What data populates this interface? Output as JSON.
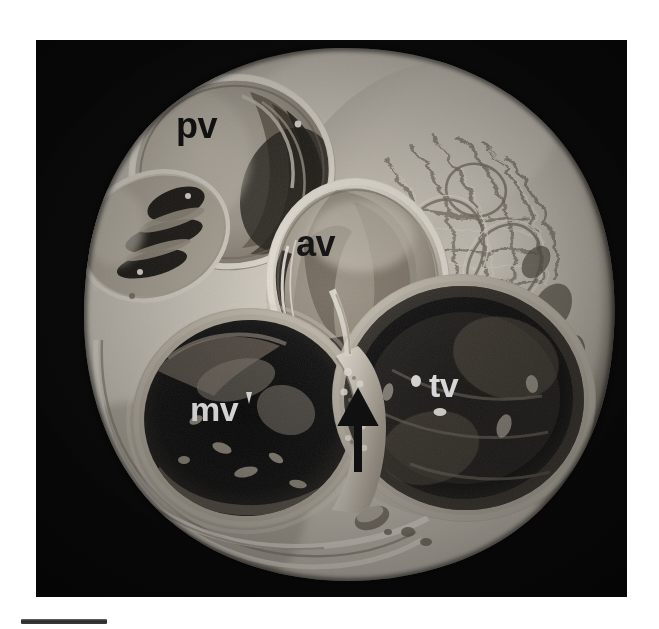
{
  "figure": {
    "kind": "anatomical-photograph",
    "background_color": "#ffffff",
    "plate_color": "#060606",
    "tissue_tone_light": "#d8d2c8",
    "tissue_tone_mid": "#a9a296",
    "tissue_tone_dark": "#5c564e",
    "orifice_color": "#0a0a0a"
  },
  "labels": [
    {
      "id": "pv",
      "text": "pv",
      "meaning": "pulmonary valve",
      "color": "#0d0d0d",
      "x": 176,
      "y": 108,
      "size": 34
    },
    {
      "id": "av",
      "text": "av",
      "meaning": "aortic valve",
      "color": "#0d0d0d",
      "x": 296,
      "y": 224,
      "size": 34
    },
    {
      "id": "mv",
      "text": "mv",
      "meaning": "mitral valve",
      "color": "#ffffff",
      "x": 190,
      "y": 392,
      "size": 32
    },
    {
      "id": "tv",
      "text": "tv",
      "meaning": "tricuspid valve",
      "color": "#ffffff",
      "x": 429,
      "y": 368,
      "size": 32
    }
  ],
  "annotations": {
    "arrow": {
      "name": "central-fibrous-body-arrow",
      "direction": "up",
      "color": "#080808",
      "x": 310,
      "y": 398,
      "width": 24,
      "height": 74
    },
    "marks": [
      {
        "id": "tv-dot-left",
        "color": "#f2f2f2",
        "x": 412,
        "y": 375,
        "w": 9,
        "h": 11
      },
      {
        "id": "tv-dash-below",
        "color": "#f2f2f2",
        "x": 436,
        "y": 406,
        "w": 12,
        "h": 7
      },
      {
        "id": "mv-tick-right",
        "color": "#f2f2f2",
        "x": 243,
        "y": 390,
        "w": 5,
        "h": 14
      }
    ]
  },
  "scale_bar": {
    "name": "scale-bar",
    "color": "#2a2a2a",
    "x": 21,
    "y": 619,
    "width": 86,
    "height": 5,
    "caption": ""
  },
  "plate": {
    "x": 36,
    "y": 40,
    "width": 591,
    "height": 557
  }
}
